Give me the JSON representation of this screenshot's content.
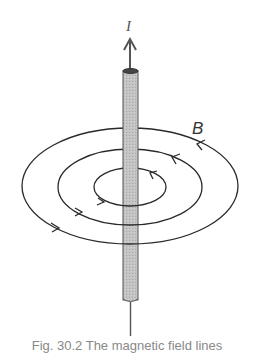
{
  "figure": {
    "current_label": "I",
    "field_label": "B",
    "caption": "Fig. 30.2 The magnetic field lines",
    "colors": {
      "wire_fill": "#bdbdbd",
      "wire_stroke": "#555555",
      "field_lines": "#2a2a2a",
      "arrow": "#555555"
    },
    "field_loops": [
      {
        "name": "outer",
        "rx": 108,
        "ry": 58
      },
      {
        "name": "middle",
        "rx": 72,
        "ry": 38
      },
      {
        "name": "inner",
        "rx": 36,
        "ry": 19
      }
    ]
  }
}
